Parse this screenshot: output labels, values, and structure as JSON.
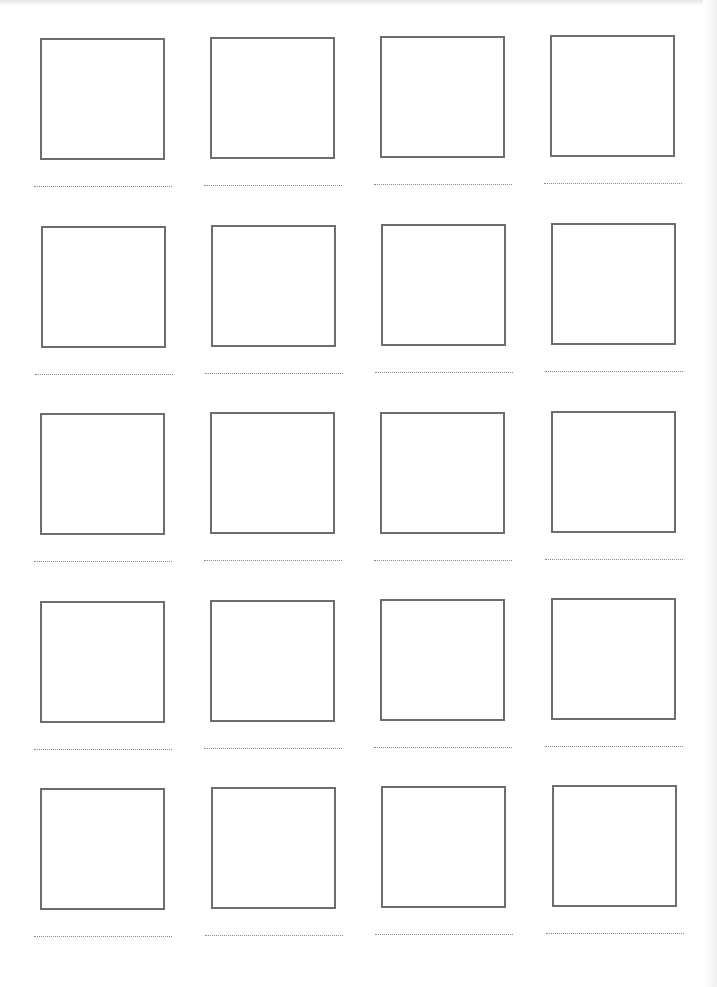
{
  "worksheet": {
    "rows": 5,
    "columns": 4,
    "border_color": "#6d6d6d",
    "line_color": "#8a8a8a",
    "cells": [
      {
        "x": 40,
        "y": 38
      },
      {
        "x": 210,
        "y": 37
      },
      {
        "x": 380,
        "y": 36
      },
      {
        "x": 550,
        "y": 35
      },
      {
        "x": 41,
        "y": 226
      },
      {
        "x": 211,
        "y": 225
      },
      {
        "x": 381,
        "y": 224
      },
      {
        "x": 551,
        "y": 223
      },
      {
        "x": 40,
        "y": 413
      },
      {
        "x": 210,
        "y": 412
      },
      {
        "x": 380,
        "y": 412
      },
      {
        "x": 551,
        "y": 411
      },
      {
        "x": 40,
        "y": 601
      },
      {
        "x": 210,
        "y": 600
      },
      {
        "x": 380,
        "y": 599
      },
      {
        "x": 551,
        "y": 598
      },
      {
        "x": 40,
        "y": 788
      },
      {
        "x": 211,
        "y": 787
      },
      {
        "x": 381,
        "y": 786
      },
      {
        "x": 552,
        "y": 785
      }
    ]
  }
}
